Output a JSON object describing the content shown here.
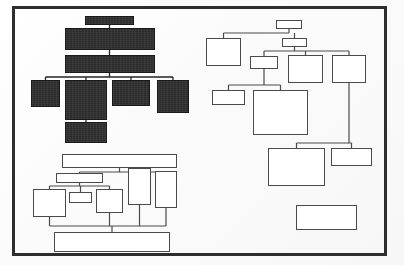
{
  "page": {
    "kind": "scanned-block-diagram",
    "width": 404,
    "height": 265,
    "background_color": "#fdfdfd",
    "frame": {
      "name": "outer-border",
      "x": 12,
      "y": 6,
      "w": 375,
      "h": 250,
      "stroke_color": "#2e2e2e",
      "stroke_width": 3
    }
  },
  "palette": {
    "paper": "#fdfdfd",
    "frame_stroke": "#2e2e2e",
    "box_stroke": "#4a4a4a",
    "box_fill": "#ffffff",
    "filled_box_fill": "#2b2b2b",
    "filled_box_stroke": "#1a1a1a",
    "connector": "#4a4a4a"
  },
  "clusters": [
    {
      "id": "cluster-top-left",
      "name": "top-left-filled-hierarchy",
      "style": "filled",
      "label": "",
      "nodes": [
        {
          "id": "tl-1",
          "name": "node-tl-root",
          "label": "",
          "x": 85,
          "y": 16,
          "w": 49,
          "h": 9,
          "filled": true
        },
        {
          "id": "tl-2",
          "name": "node-tl-level2",
          "label": "",
          "x": 65,
          "y": 28,
          "w": 90,
          "h": 22,
          "filled": true
        },
        {
          "id": "tl-3",
          "name": "node-tl-level3",
          "label": "",
          "x": 65,
          "y": 55,
          "w": 90,
          "h": 18,
          "filled": true
        },
        {
          "id": "tl-4",
          "name": "node-tl-leaf-1",
          "label": "",
          "x": 31,
          "y": 80,
          "w": 29,
          "h": 27,
          "filled": true
        },
        {
          "id": "tl-5",
          "name": "node-tl-leaf-2",
          "label": "",
          "x": 65,
          "y": 80,
          "w": 42,
          "h": 40,
          "filled": true
        },
        {
          "id": "tl-6",
          "name": "node-tl-leaf-3",
          "label": "",
          "x": 112,
          "y": 80,
          "w": 38,
          "h": 26,
          "filled": true
        },
        {
          "id": "tl-7",
          "name": "node-tl-leaf-4",
          "label": "",
          "x": 157,
          "y": 80,
          "w": 32,
          "h": 33,
          "filled": true
        },
        {
          "id": "tl-8",
          "name": "node-tl-subleaf",
          "label": "",
          "x": 65,
          "y": 122,
          "w": 42,
          "h": 21,
          "filled": true
        }
      ],
      "edges": [
        {
          "from": "tl-1",
          "to": "tl-2",
          "type": "vertical"
        },
        {
          "from": "tl-2",
          "to": "tl-3",
          "type": "vertical"
        },
        {
          "from": "tl-3",
          "to": "tl-4",
          "type": "orthogonal"
        },
        {
          "from": "tl-3",
          "to": "tl-5",
          "type": "orthogonal"
        },
        {
          "from": "tl-3",
          "to": "tl-6",
          "type": "orthogonal"
        },
        {
          "from": "tl-3",
          "to": "tl-7",
          "type": "orthogonal"
        },
        {
          "from": "tl-5",
          "to": "tl-8",
          "type": "vertical"
        }
      ]
    },
    {
      "id": "cluster-bottom-left",
      "name": "bottom-left-outline-hierarchy",
      "style": "outline",
      "label": "",
      "nodes": [
        {
          "id": "bl-1",
          "name": "node-bl-top-bar",
          "label": "",
          "x": 62,
          "y": 154,
          "w": 115,
          "h": 14,
          "filled": false
        },
        {
          "id": "bl-2",
          "name": "node-bl-wide-1",
          "label": "",
          "x": 56,
          "y": 173,
          "w": 47,
          "h": 10,
          "filled": false
        },
        {
          "id": "bl-3",
          "name": "node-bl-tall-1",
          "label": "",
          "x": 128,
          "y": 168,
          "w": 23,
          "h": 37,
          "filled": false
        },
        {
          "id": "bl-4",
          "name": "node-bl-tall-2",
          "label": "",
          "x": 155,
          "y": 171,
          "w": 22,
          "h": 37,
          "filled": false
        },
        {
          "id": "bl-5",
          "name": "node-bl-big-left",
          "label": "",
          "x": 33,
          "y": 189,
          "w": 33,
          "h": 28,
          "filled": false
        },
        {
          "id": "bl-6",
          "name": "node-bl-small-mid",
          "label": "",
          "x": 69,
          "y": 192,
          "w": 23,
          "h": 11,
          "filled": false
        },
        {
          "id": "bl-7",
          "name": "node-bl-mid-box",
          "label": "",
          "x": 96,
          "y": 189,
          "w": 27,
          "h": 24,
          "filled": false
        },
        {
          "id": "bl-8",
          "name": "node-bl-bottom-bar",
          "label": "",
          "x": 54,
          "y": 232,
          "w": 116,
          "h": 20,
          "filled": false
        }
      ],
      "edges": [
        {
          "from": "bl-1",
          "to": "bl-2",
          "type": "orthogonal"
        },
        {
          "from": "bl-1",
          "to": "bl-3",
          "type": "orthogonal"
        },
        {
          "from": "bl-1",
          "to": "bl-4",
          "type": "orthogonal"
        },
        {
          "from": "bl-2",
          "to": "bl-5",
          "type": "orthogonal"
        },
        {
          "from": "bl-2",
          "to": "bl-6",
          "type": "orthogonal"
        },
        {
          "from": "bl-2",
          "to": "bl-7",
          "type": "orthogonal"
        },
        {
          "from": "bl-5",
          "to": "bl-8",
          "type": "orthogonal"
        },
        {
          "from": "bl-7",
          "to": "bl-8",
          "type": "orthogonal"
        },
        {
          "from": "bl-3",
          "to": "bl-8",
          "type": "orthogonal"
        },
        {
          "from": "bl-4",
          "to": "bl-8",
          "type": "orthogonal"
        }
      ]
    },
    {
      "id": "cluster-right",
      "name": "right-outline-hierarchy",
      "style": "outline",
      "label": "",
      "nodes": [
        {
          "id": "r-1",
          "name": "node-r-root",
          "label": "",
          "x": 276,
          "y": 20,
          "w": 26,
          "h": 9,
          "filled": false
        },
        {
          "id": "r-2",
          "name": "node-r-level2",
          "label": "",
          "x": 282,
          "y": 38,
          "w": 25,
          "h": 9,
          "filled": false
        },
        {
          "id": "r-3",
          "name": "node-r-left-big",
          "label": "",
          "x": 206,
          "y": 38,
          "w": 35,
          "h": 28,
          "filled": false
        },
        {
          "id": "r-4",
          "name": "node-r-mid-bar",
          "label": "",
          "x": 250,
          "y": 56,
          "w": 28,
          "h": 13,
          "filled": false
        },
        {
          "id": "r-5",
          "name": "node-r-center-box",
          "label": "",
          "x": 288,
          "y": 55,
          "w": 35,
          "h": 28,
          "filled": false
        },
        {
          "id": "r-6",
          "name": "node-r-right-box",
          "label": "",
          "x": 332,
          "y": 55,
          "w": 34,
          "h": 28,
          "filled": false
        },
        {
          "id": "r-7",
          "name": "node-r-sub-left",
          "label": "",
          "x": 212,
          "y": 90,
          "w": 33,
          "h": 15,
          "filled": false
        },
        {
          "id": "r-8",
          "name": "node-r-sub-big",
          "label": "",
          "x": 253,
          "y": 90,
          "w": 55,
          "h": 45,
          "filled": false
        },
        {
          "id": "r-9",
          "name": "node-r-lower-big",
          "label": "",
          "x": 268,
          "y": 148,
          "w": 57,
          "h": 38,
          "filled": false
        },
        {
          "id": "r-10",
          "name": "node-r-lower-small",
          "label": "",
          "x": 331,
          "y": 148,
          "w": 41,
          "h": 18,
          "filled": false
        },
        {
          "id": "r-11",
          "name": "node-r-isolated",
          "label": "",
          "x": 296,
          "y": 205,
          "w": 61,
          "h": 25,
          "filled": false
        }
      ],
      "edges": [
        {
          "from": "r-1",
          "to": "r-2",
          "type": "vertical"
        },
        {
          "from": "r-1",
          "to": "r-3",
          "type": "orthogonal"
        },
        {
          "from": "r-2",
          "to": "r-4",
          "type": "orthogonal"
        },
        {
          "from": "r-2",
          "to": "r-5",
          "type": "orthogonal"
        },
        {
          "from": "r-2",
          "to": "r-6",
          "type": "orthogonal"
        },
        {
          "from": "r-4",
          "to": "r-7",
          "type": "orthogonal"
        },
        {
          "from": "r-4",
          "to": "r-8",
          "type": "orthogonal"
        },
        {
          "from": "r-6",
          "to": "r-9",
          "type": "orthogonal"
        },
        {
          "from": "r-6",
          "to": "r-10",
          "type": "orthogonal"
        }
      ]
    }
  ],
  "summary": {
    "total_nodes": 27,
    "filled_nodes": 8,
    "outline_nodes": 19,
    "cluster_count": 3
  }
}
